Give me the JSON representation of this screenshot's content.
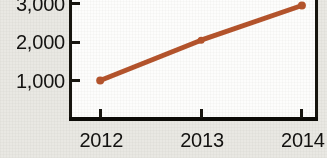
{
  "chart_data": {
    "type": "line",
    "title": "",
    "xlabel": "",
    "ylabel": "",
    "categories": [
      "2012",
      "2013",
      "2014"
    ],
    "x": [
      2012,
      2013,
      2014
    ],
    "series": [
      {
        "name": "",
        "values": [
          1000,
          2050,
          2950
        ],
        "color": "#b5542c",
        "marker": "circle",
        "line_width": 5
      }
    ],
    "ytick_labels": [
      "1,000",
      "2,000",
      "3,000"
    ],
    "ytick_values": [
      1000,
      2000,
      3000
    ],
    "xtick_labels": [
      "2012",
      "2013",
      "2014"
    ],
    "ylim": [
      0,
      3250
    ],
    "xlim": [
      2011.7,
      2014.15
    ],
    "grid": false,
    "legend": false,
    "legend_position": "none",
    "note": "plot frame top edge is cropped off the image"
  },
  "axis": {
    "y_labels": [
      {
        "text": "3,000",
        "value": 3000
      },
      {
        "text": "2,000",
        "value": 2000
      },
      {
        "text": "1,000",
        "value": 1000
      }
    ],
    "x_labels": [
      {
        "text": "2012",
        "value": 2012
      },
      {
        "text": "2013",
        "value": 2013
      },
      {
        "text": "2014",
        "value": 2014
      }
    ]
  },
  "style": {
    "line_color": "#b5542c",
    "marker_color": "#b5542c",
    "axis_color": "#17150f",
    "plot_background": "#fdfdfc",
    "page_background": "#e9e8e3",
    "text_color": "#131210"
  }
}
